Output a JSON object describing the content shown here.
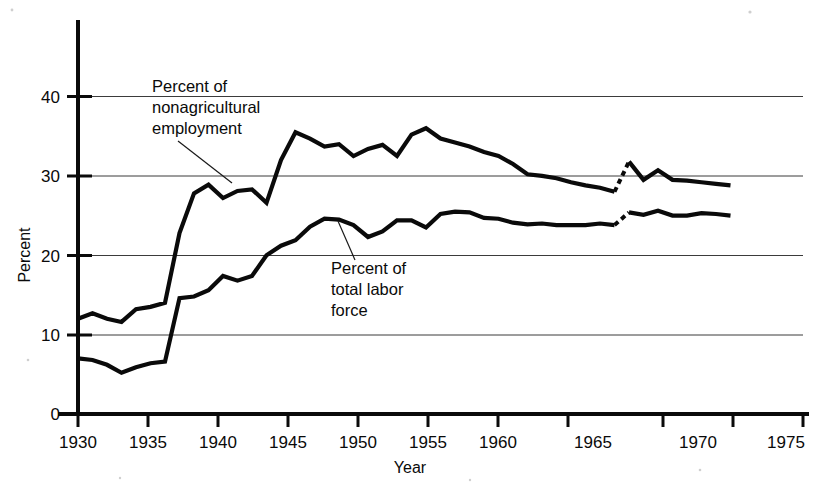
{
  "chart_data": {
    "type": "line",
    "title": "",
    "xlabel": "Year",
    "ylabel": "Percent",
    "xlim": [
      1930,
      1975
    ],
    "ylim": [
      0,
      42
    ],
    "xticks": [
      1930,
      1935,
      1940,
      1945,
      1950,
      1955,
      1960,
      1965,
      1970,
      1975
    ],
    "xtick_labels": [
      "1930",
      "1935",
      "1940",
      "1945",
      "1950",
      "1955",
      "1960",
      "1965",
      "1970",
      "1975"
    ],
    "yticks": [
      0,
      10,
      20,
      30,
      40
    ],
    "ytick_labels": [
      "0",
      "10",
      "20",
      "30",
      "40"
    ],
    "grid": "horizontal",
    "legend": "none",
    "x": [
      1930,
      1931,
      1932,
      1933,
      1934,
      1935,
      1936,
      1937,
      1938,
      1939,
      1940,
      1941,
      1942,
      1943,
      1944,
      1945,
      1946,
      1947,
      1948,
      1949,
      1950,
      1951,
      1952,
      1953,
      1954,
      1955,
      1956,
      1957,
      1958,
      1959,
      1960,
      1961,
      1962,
      1963,
      1964,
      1965,
      1966,
      1967,
      1968,
      1969,
      1970,
      1971,
      1972,
      1973,
      1974,
      1975
    ],
    "series": [
      {
        "name": "Percent of nonagricultural employment",
        "annotation": "Percent of nonagricultural employment",
        "values": [
          12.0,
          12.7,
          12.0,
          11.6,
          13.2,
          13.5,
          14.0,
          22.8,
          27.8,
          28.9,
          27.2,
          28.1,
          28.3,
          26.6,
          32.0,
          35.5,
          34.7,
          33.7,
          34.0,
          32.5,
          33.4,
          33.9,
          32.5,
          35.2,
          36.0,
          34.7,
          34.2,
          33.7,
          33.0,
          32.5,
          31.5,
          30.2,
          30.0,
          29.7,
          29.2,
          28.8,
          28.5,
          28.0,
          31.8,
          29.5,
          30.7,
          29.5,
          29.4,
          29.2,
          29.0,
          28.8
        ],
        "break_segment": {
          "from_year": 1967,
          "to_year": 1968,
          "from_value": 28.0,
          "to_value": 31.8,
          "style": "dashed"
        }
      },
      {
        "name": "Percent of total labor force",
        "annotation": "Percent of total labor force",
        "values": [
          7.0,
          6.8,
          6.2,
          5.2,
          5.9,
          6.4,
          6.6,
          14.6,
          14.8,
          15.6,
          17.4,
          16.8,
          17.4,
          20.0,
          21.2,
          21.9,
          23.6,
          24.6,
          24.5,
          23.8,
          22.3,
          23.0,
          24.4,
          24.4,
          23.5,
          25.2,
          25.5,
          25.4,
          24.7,
          24.6,
          24.1,
          23.9,
          24.0,
          23.8,
          23.8,
          23.8,
          24.0,
          23.8,
          25.4,
          25.1,
          25.6,
          25.0,
          25.0,
          25.3,
          25.2,
          25.0
        ],
        "break_segment": {
          "from_year": 1967,
          "to_year": 1968,
          "from_value": 23.8,
          "to_value": 25.4,
          "style": "dashed"
        }
      }
    ],
    "annotations": [
      {
        "id": "nonagricultural-annotation",
        "lines": [
          "Percent of",
          "nonagricultural",
          "employment"
        ],
        "text_x": 152,
        "text_y": 92,
        "leader": {
          "x1": 182,
          "y1": 128,
          "x2": 232,
          "y2": 180
        }
      },
      {
        "id": "total-labor-force-annotation",
        "lines": [
          "Percent of",
          "total labor",
          "force"
        ],
        "text_x": 331,
        "text_y": 268,
        "leader": {
          "x1": 351,
          "y1": 258,
          "x2": 335,
          "y2": 222
        }
      }
    ]
  },
  "axes": {
    "y_axis_title": "Percent",
    "x_axis_title": "Year"
  }
}
